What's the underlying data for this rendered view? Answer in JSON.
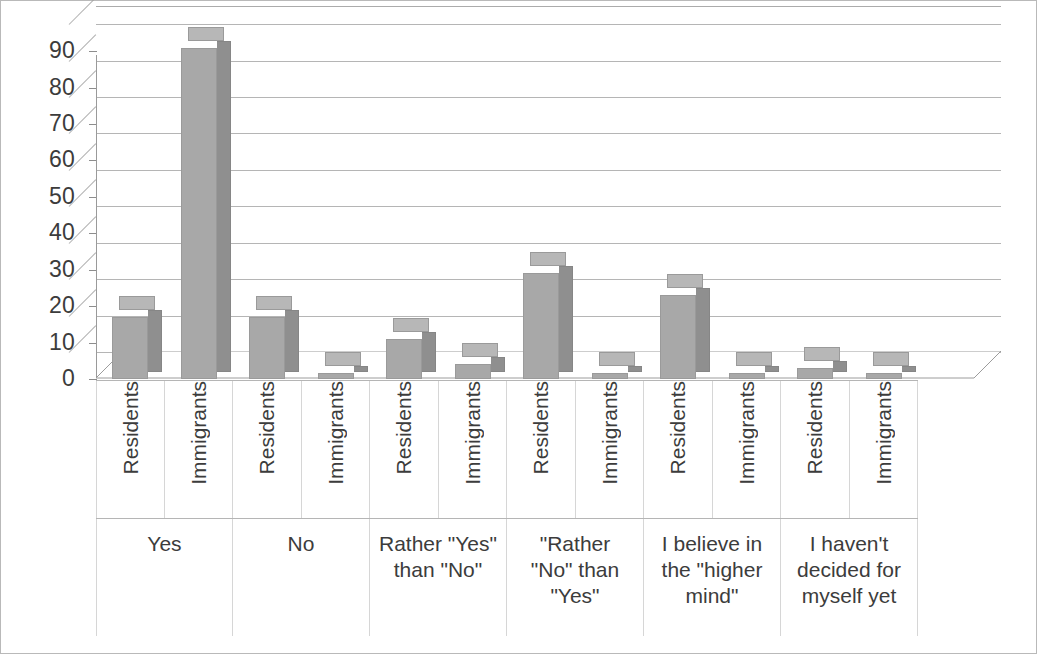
{
  "chart_data": {
    "type": "bar",
    "title": "",
    "subtitle": "",
    "xlabel": "",
    "ylabel": "",
    "ylim": [
      0,
      95
    ],
    "yticks": [
      0,
      10,
      20,
      30,
      40,
      50,
      60,
      70,
      80,
      90
    ],
    "grid": true,
    "legend": "none",
    "style": "3d-clustered-column",
    "series_labels": [
      "Residents",
      "Immigrants"
    ],
    "categories": [
      "Yes",
      "No",
      "Rather \"Yes\" than \"No\"",
      "\"Rather \"No\" than \"Yes\"",
      "I believe in the \"higher mind\"",
      "I haven't decided for myself yet"
    ],
    "categories_display": [
      "Yes",
      "No",
      "Rather \"Yes\"\nthan \"No\"",
      "\"Rather\n\"No\" than\n\"Yes\"",
      "I believe in\nthe \"higher\nmind\"",
      "I haven't\ndecided for\nmyself yet"
    ],
    "series": [
      {
        "name": "Residents",
        "values": [
          17,
          17,
          11,
          29,
          23,
          3
        ]
      },
      {
        "name": "Immigrants",
        "values": [
          91,
          1,
          4,
          1,
          1,
          1
        ]
      }
    ],
    "bars": [
      {
        "group": "Yes",
        "series": "Residents",
        "value": 17
      },
      {
        "group": "Yes",
        "series": "Immigrants",
        "value": 91
      },
      {
        "group": "No",
        "series": "Residents",
        "value": 17
      },
      {
        "group": "No",
        "series": "Immigrants",
        "value": 1
      },
      {
        "group": "Rather \"Yes\" than \"No\"",
        "series": "Residents",
        "value": 11
      },
      {
        "group": "Rather \"Yes\" than \"No\"",
        "series": "Immigrants",
        "value": 4
      },
      {
        "group": "\"Rather \"No\" than \"Yes\"",
        "series": "Residents",
        "value": 29
      },
      {
        "group": "\"Rather \"No\" than \"Yes\"",
        "series": "Immigrants",
        "value": 1
      },
      {
        "group": "I believe in the \"higher mind\"",
        "series": "Residents",
        "value": 23
      },
      {
        "group": "I believe in the \"higher mind\"",
        "series": "Immigrants",
        "value": 1
      },
      {
        "group": "I haven't decided for myself yet",
        "series": "Residents",
        "value": 3
      },
      {
        "group": "I haven't decided for myself yet",
        "series": "Immigrants",
        "value": 1
      }
    ],
    "colors": {
      "bar_front": "#a8a8a8",
      "bar_side": "#8f8f8f",
      "bar_top": "#b7b7b7",
      "gridline": "#9c9c9c",
      "axis_text": "#3c3c3c",
      "plot_background": "#ffffff",
      "frame": "#b9b9b9"
    }
  },
  "axis": {
    "y_tick_labels": [
      "90",
      "80",
      "70",
      "60",
      "50",
      "40",
      "30",
      "20",
      "10",
      "0"
    ],
    "series_labels_repeating": [
      "Residents",
      "Immigrants",
      "Residents",
      "Immigrants",
      "Residents",
      "Immigrants",
      "Residents",
      "Immigrants",
      "Residents",
      "Immigrants",
      "Residents",
      "Immigrants"
    ],
    "group_labels": [
      "Yes",
      "No",
      "Rather \"Yes\" than \"No\"",
      "\"Rather \"No\" than \"Yes\"",
      "I believe in the \"higher mind\"",
      "I haven't decided for myself yet"
    ]
  }
}
